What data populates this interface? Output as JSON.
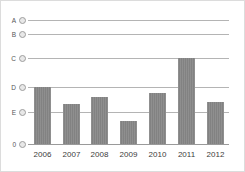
{
  "chart_data": {
    "type": "bar",
    "title": "",
    "subtitle": "",
    "xlabel": "",
    "ylabel": "",
    "categories": [
      "2006",
      "2007",
      "2008",
      "2009",
      "2010",
      "2011",
      "2012"
    ],
    "values": [
      4,
      3.45,
      3.7,
      2.8,
      3.8,
      5,
      3.55
    ],
    "series": [
      {
        "name": "",
        "values": [
          4,
          3.45,
          3.7,
          2.8,
          3.8,
          5,
          3.55
        ]
      }
    ],
    "ytick_labels": [
      "0",
      "E",
      "D",
      "C",
      "B",
      "A"
    ],
    "ytick_values": [
      0,
      3,
      4,
      5,
      6,
      6.8
    ],
    "ylim": [
      0,
      7.1
    ],
    "grid": true,
    "legend": false,
    "legend_position": "none",
    "bar_color": "#828282",
    "gridline_color": "#b4b4b4",
    "axis_color": "#9a9a9a",
    "marker_color": "#e8e8e8",
    "border_color": "#dcdcdc",
    "annotations": []
  },
  "geometry": {
    "plot_left": 27,
    "plot_right": 232,
    "baseline_y": 143,
    "gridlines": [
      {
        "label": "A",
        "y": 19
      },
      {
        "label": "B",
        "y": 33
      },
      {
        "label": "C",
        "y": 57
      },
      {
        "label": "D",
        "y": 86
      },
      {
        "label": "E",
        "y": 111
      },
      {
        "label": "0",
        "y": 143
      }
    ],
    "bars": [
      {
        "category": "2006",
        "x": 33,
        "top": 86,
        "width": 17
      },
      {
        "category": "2007",
        "x": 62,
        "top": 103,
        "width": 17
      },
      {
        "category": "2008",
        "x": 90,
        "top": 96,
        "width": 17
      },
      {
        "category": "2009",
        "x": 119,
        "top": 120,
        "width": 17
      },
      {
        "category": "2010",
        "x": 148,
        "top": 92,
        "width": 17
      },
      {
        "category": "2011",
        "x": 177,
        "top": 57,
        "width": 17
      },
      {
        "category": "2012",
        "x": 206,
        "top": 101,
        "width": 17
      }
    ],
    "gridline_right": 228,
    "marker_x": 18
  }
}
